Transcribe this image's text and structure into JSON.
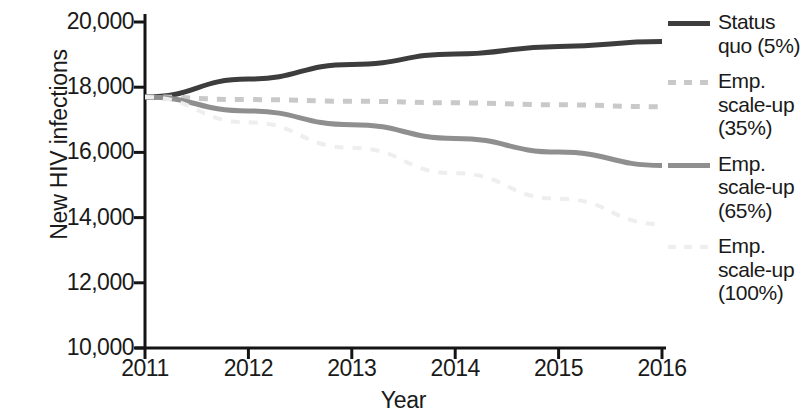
{
  "chart_data": {
    "type": "line",
    "title": "",
    "xlabel": "Year",
    "ylabel": "New HIV infections",
    "x": [
      2011,
      2012,
      2013,
      2014,
      2015,
      2016
    ],
    "xticklabels": [
      "2011",
      "2012",
      "2013",
      "2014",
      "2015",
      "2016"
    ],
    "xlim": [
      2011,
      2016
    ],
    "yticklabels": [
      "20,000",
      "18,000",
      "16,000",
      "14,000",
      "12,000",
      "10,000"
    ],
    "yticks": [
      20000,
      18000,
      16000,
      14000,
      12000,
      10000
    ],
    "ylim": [
      10000,
      20000
    ],
    "grid": false,
    "legend_position": "right",
    "series": [
      {
        "name": "Status quo (5%)",
        "legend_label": "Status\nquo (5%)",
        "color": "#3d3d3d",
        "style": "solid",
        "width": 5,
        "values": [
          17700,
          18250,
          18700,
          19020,
          19250,
          19400
        ]
      },
      {
        "name": "Emp. scale-up (35%)",
        "legend_label": "Emp.\nscale-up\n(35%)",
        "color": "#c9c9c9",
        "style": "dashed",
        "width": 5,
        "values": [
          17700,
          17620,
          17570,
          17520,
          17460,
          17400
        ]
      },
      {
        "name": "Emp. scale-up (65%)",
        "legend_label": "Emp.\nscale-up\n(65%)",
        "color": "#8f8f8f",
        "style": "solid",
        "width": 5,
        "values": [
          17700,
          17270,
          16850,
          16430,
          16010,
          15600
        ]
      },
      {
        "name": "Emp. scale-up (100%)",
        "legend_label": "Emp.\nscale-up\n(100%)",
        "color": "#eeeeee",
        "style": "dashed",
        "width": 4,
        "values": [
          17700,
          16920,
          16140,
          15360,
          14580,
          13800
        ]
      }
    ]
  },
  "axes": {
    "y_title": "New HIV infections",
    "x_title": "Year",
    "axis_color": "#141414"
  }
}
